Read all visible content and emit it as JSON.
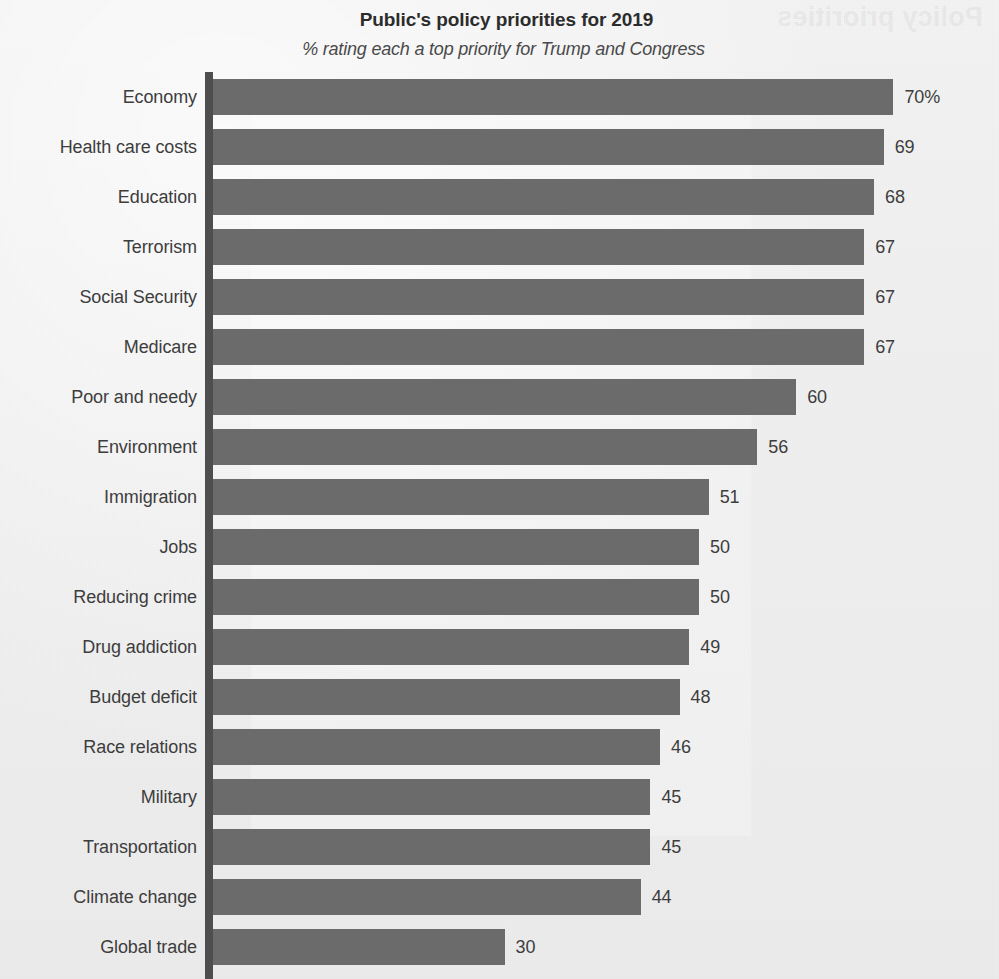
{
  "header": {
    "title": "Public's policy priorities for 2019",
    "subtitle": "% rating each a top priority for Trump and Congress"
  },
  "ghost": {
    "title_reversed": "Policy priorities",
    "subtitle_reversed": "percentage"
  },
  "style": {
    "bar_color": "#6b6b6b",
    "axis_color": "#4e4e4e",
    "background_color": "#f0f0f0",
    "text_color": "#3d3d3d"
  },
  "chart_data": {
    "type": "bar",
    "orientation": "horizontal",
    "title": "Public's policy priorities for 2019",
    "subtitle": "% rating each a top priority for Trump and Congress",
    "xlabel": "",
    "ylabel": "",
    "xlim": [
      0,
      70
    ],
    "grid": false,
    "legend": false,
    "unit_suffix": "%",
    "categories": [
      "Economy",
      "Health care costs",
      "Education",
      "Terrorism",
      "Social Security",
      "Medicare",
      "Poor and needy",
      "Environment",
      "Immigration",
      "Jobs",
      "Reducing crime",
      "Drug addiction",
      "Budget deficit",
      "Race relations",
      "Military",
      "Transportation",
      "Climate change",
      "Global trade"
    ],
    "values": [
      70,
      69,
      68,
      67,
      67,
      67,
      60,
      56,
      51,
      50,
      50,
      49,
      48,
      46,
      45,
      45,
      44,
      30
    ],
    "value_labels": [
      "70%",
      "69",
      "68",
      "67",
      "67",
      "67",
      "60",
      "56",
      "51",
      "50",
      "50",
      "49",
      "48",
      "46",
      "45",
      "45",
      "44",
      "30"
    ],
    "rows": [
      {
        "label": "Economy",
        "value": 70,
        "value_label": "70%"
      },
      {
        "label": "Health care costs",
        "value": 69,
        "value_label": "69"
      },
      {
        "label": "Education",
        "value": 68,
        "value_label": "68"
      },
      {
        "label": "Terrorism",
        "value": 67,
        "value_label": "67"
      },
      {
        "label": "Social Security",
        "value": 67,
        "value_label": "67"
      },
      {
        "label": "Medicare",
        "value": 67,
        "value_label": "67"
      },
      {
        "label": "Poor and needy",
        "value": 60,
        "value_label": "60"
      },
      {
        "label": "Environment",
        "value": 56,
        "value_label": "56"
      },
      {
        "label": "Immigration",
        "value": 51,
        "value_label": "51"
      },
      {
        "label": "Jobs",
        "value": 50,
        "value_label": "50"
      },
      {
        "label": "Reducing crime",
        "value": 50,
        "value_label": "50"
      },
      {
        "label": "Drug addiction",
        "value": 49,
        "value_label": "49"
      },
      {
        "label": "Budget deficit",
        "value": 48,
        "value_label": "48"
      },
      {
        "label": "Race relations",
        "value": 46,
        "value_label": "46"
      },
      {
        "label": "Military",
        "value": 45,
        "value_label": "45"
      },
      {
        "label": "Transportation",
        "value": 45,
        "value_label": "45"
      },
      {
        "label": "Climate change",
        "value": 44,
        "value_label": "44"
      },
      {
        "label": "Global trade",
        "value": 30,
        "value_label": "30"
      }
    ]
  }
}
